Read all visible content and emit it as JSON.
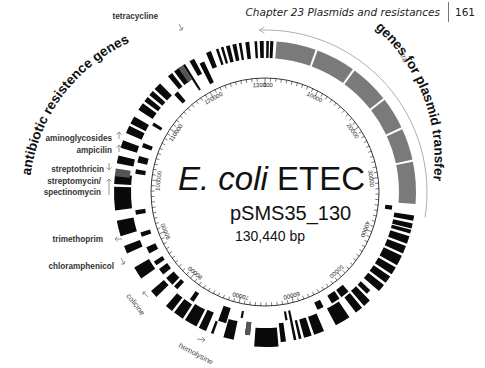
{
  "header": {
    "chapter": "Chapter 23  Plasmids and resistances",
    "page_number": "161"
  },
  "map": {
    "title_italic": "E. coli",
    "title_rest": " ETEC",
    "plasmid_name": "pSMS35_130",
    "size": "130,440 bp",
    "center": [
      265,
      192
    ],
    "tick_radius": 114,
    "gene_inner": 121,
    "gene_outer": 151,
    "outer_arc_radius": 162,
    "colors": {
      "gene": "#0a0a0a",
      "transfer": "#7a7a7a",
      "tick": "#222222",
      "arc": "#999999"
    }
  },
  "group_labels": {
    "left": "antibiotic resistence genes",
    "right": "genes for plasmid transfer",
    "tra": "tra"
  },
  "tick_labels": [
    {
      "text": "1",
      "angle": 0
    },
    {
      "text": "10000",
      "angle": 27.6
    },
    {
      "text": "20000",
      "angle": 55.2
    },
    {
      "text": "30000",
      "angle": 82.8
    },
    {
      "text": "40000",
      "angle": 110.4
    },
    {
      "text": "50000",
      "angle": 138.0
    },
    {
      "text": "60000",
      "angle": 165.6
    },
    {
      "text": "70000",
      "angle": 193.2
    },
    {
      "text": "80000",
      "angle": 220.8
    },
    {
      "text": "90000",
      "angle": 248.4
    },
    {
      "text": "100000",
      "angle": 276.0
    },
    {
      "text": "110000",
      "angle": 303.6
    },
    {
      "text": "120000",
      "angle": 331.2
    },
    {
      "text": "130000",
      "angle": 358.8
    }
  ],
  "resistance_labels": [
    {
      "text": "tetracycline",
      "x": 158,
      "y": 19,
      "arrow": "down-right",
      "ax": 182,
      "ay": 30
    },
    {
      "text": "aminoglycosides",
      "x": 112,
      "y": 141,
      "arrow": "up",
      "ax": 119,
      "ay": 139
    },
    {
      "text": "ampicilin",
      "x": 112,
      "y": 153,
      "arrow": "up",
      "ax": 119,
      "ay": 152
    },
    {
      "text": "streptothricin",
      "x": 104,
      "y": 172,
      "arrow": "down",
      "ax": 109,
      "ay": 170
    },
    {
      "text": "streptomycin/",
      "x": 101,
      "y": 184,
      "arrow": "up-long",
      "ax": 109,
      "ay": 185
    },
    {
      "text": "spectinomycin",
      "x": 101,
      "y": 195,
      "arrow": "none",
      "ax": 0,
      "ay": 0
    },
    {
      "text": "trimethoprim",
      "x": 103,
      "y": 242,
      "arrow": "up-left",
      "ax": 115,
      "ay": 239
    },
    {
      "text": "chloramphenicol",
      "x": 114,
      "y": 269,
      "arrow": "down-right",
      "ax": 124,
      "ay": 264
    }
  ],
  "toxin_labels": [
    {
      "text": "colicine",
      "x": 126,
      "y": 296,
      "rotate": 52,
      "ax": 143,
      "ay": 292
    },
    {
      "text": "hemolysine",
      "x": 178,
      "y": 347,
      "rotate": 28,
      "ax": 203,
      "ay": 339
    }
  ],
  "transfer_region": {
    "start": 4,
    "end": 95,
    "breaks": [
      20,
      36,
      52,
      65,
      78
    ]
  },
  "genes": [
    {
      "s": 96,
      "e": 98,
      "r0": 121,
      "r1": 128
    },
    {
      "s": 99,
      "e": 101,
      "r0": 131,
      "r1": 151
    },
    {
      "s": 102,
      "e": 104,
      "r0": 131,
      "r1": 151
    },
    {
      "s": 104.5,
      "e": 106,
      "r0": 131,
      "r1": 151
    },
    {
      "s": 107,
      "e": 110,
      "r0": 131,
      "r1": 151
    },
    {
      "s": 111,
      "e": 114,
      "r0": 131,
      "r1": 151
    },
    {
      "s": 115,
      "e": 119,
      "r0": 131,
      "r1": 151
    },
    {
      "s": 120,
      "e": 123,
      "r0": 131,
      "r1": 151
    },
    {
      "s": 124,
      "e": 127,
      "r0": 131,
      "r1": 151
    },
    {
      "s": 128,
      "e": 131,
      "r0": 131,
      "r1": 151
    },
    {
      "s": 133,
      "e": 135,
      "r0": 131,
      "r1": 144
    },
    {
      "s": 136,
      "e": 139,
      "r0": 131,
      "r1": 151
    },
    {
      "s": 140,
      "e": 144,
      "r0": 121,
      "r1": 130
    },
    {
      "s": 140,
      "e": 143,
      "r0": 132,
      "r1": 151
    },
    {
      "s": 145,
      "e": 149,
      "r0": 121,
      "r1": 130
    },
    {
      "s": 146,
      "e": 152,
      "r0": 132,
      "r1": 151
    },
    {
      "s": 153,
      "e": 156,
      "r0": 121,
      "r1": 129
    },
    {
      "s": 157,
      "e": 161,
      "r0": 132,
      "r1": 151
    },
    {
      "s": 162,
      "e": 165,
      "r0": 132,
      "r1": 151
    },
    {
      "s": 166,
      "e": 167,
      "r0": 132,
      "r1": 151
    },
    {
      "s": 168,
      "e": 169,
      "r0": 121,
      "r1": 151
    },
    {
      "s": 170,
      "e": 171,
      "r0": 121,
      "r1": 130
    },
    {
      "s": 172,
      "e": 174,
      "r0": 132,
      "r1": 151
    },
    {
      "s": 175,
      "e": 184,
      "r0": 136,
      "r1": 155
    },
    {
      "s": 186,
      "e": 188,
      "r0": 131,
      "r1": 144
    },
    {
      "s": 190,
      "e": 191,
      "r0": 121,
      "r1": 128
    },
    {
      "s": 192,
      "e": 196,
      "r0": 132,
      "r1": 151
    },
    {
      "s": 196.5,
      "e": 200,
      "r0": 121,
      "r1": 137
    },
    {
      "s": 200,
      "e": 201,
      "r0": 138,
      "r1": 151
    },
    {
      "s": 203,
      "e": 206,
      "r0": 131,
      "r1": 151
    },
    {
      "s": 207,
      "e": 212,
      "r0": 132,
      "r1": 151
    },
    {
      "s": 213,
      "e": 215,
      "r0": 121,
      "r1": 131
    },
    {
      "s": 213,
      "e": 217,
      "r0": 134,
      "r1": 151
    },
    {
      "s": 218,
      "e": 221,
      "r0": 134,
      "r1": 151
    },
    {
      "s": 222,
      "e": 224,
      "r0": 121,
      "r1": 131
    },
    {
      "s": 225,
      "e": 229,
      "r0": 121,
      "r1": 131
    },
    {
      "s": 226,
      "e": 229,
      "r0": 134,
      "r1": 151
    },
    {
      "s": 231,
      "e": 234,
      "r0": 121,
      "r1": 131
    },
    {
      "s": 235,
      "e": 240,
      "r0": 134,
      "r1": 151
    },
    {
      "s": 236,
      "e": 238,
      "r0": 121,
      "r1": 131
    },
    {
      "s": 242,
      "e": 245,
      "r0": 121,
      "r1": 131
    },
    {
      "s": 246,
      "e": 249,
      "r0": 134,
      "r1": 151
    },
    {
      "s": 250,
      "e": 252,
      "r0": 121,
      "r1": 131
    },
    {
      "s": 253,
      "e": 259,
      "r0": 134,
      "r1": 151
    },
    {
      "s": 260,
      "e": 262,
      "r0": 121,
      "r1": 131
    },
    {
      "s": 263,
      "e": 272,
      "r0": 134,
      "r1": 151
    },
    {
      "s": 273,
      "e": 277,
      "r0": 134,
      "r1": 151
    },
    {
      "s": 278,
      "e": 280,
      "r0": 121,
      "r1": 131
    },
    {
      "s": 281,
      "e": 284,
      "r0": 134,
      "r1": 151
    },
    {
      "s": 283,
      "e": 286,
      "r0": 121,
      "r1": 131
    },
    {
      "s": 287,
      "e": 290,
      "r0": 134,
      "r1": 151
    },
    {
      "s": 290,
      "e": 292,
      "r0": 121,
      "r1": 131
    },
    {
      "s": 293,
      "e": 296,
      "r0": 134,
      "r1": 151
    },
    {
      "s": 297,
      "e": 300,
      "r0": 134,
      "r1": 151
    },
    {
      "s": 300.5,
      "e": 302,
      "r0": 121,
      "r1": 131
    },
    {
      "s": 303,
      "e": 306,
      "r0": 134,
      "r1": 151
    },
    {
      "s": 307,
      "e": 309,
      "r0": 134,
      "r1": 151
    },
    {
      "s": 310,
      "e": 312,
      "r0": 134,
      "r1": 151
    },
    {
      "s": 313,
      "e": 316,
      "r0": 134,
      "r1": 151
    },
    {
      "s": 317,
      "e": 319,
      "r0": 121,
      "r1": 133
    },
    {
      "s": 320,
      "e": 322,
      "r0": 134,
      "r1": 151
    },
    {
      "s": 323,
      "e": 326,
      "r0": 134,
      "r1": 151
    },
    {
      "s": 327,
      "e": 328,
      "r0": 121,
      "r1": 151
    },
    {
      "s": 330,
      "e": 332,
      "r0": 134,
      "r1": 151
    },
    {
      "s": 333,
      "e": 335,
      "r0": 121,
      "r1": 144
    },
    {
      "s": 337,
      "e": 339,
      "r0": 134,
      "r1": 151
    },
    {
      "s": 341,
      "e": 342,
      "r0": 134,
      "r1": 151
    },
    {
      "s": 343,
      "e": 344,
      "r0": 134,
      "r1": 151
    },
    {
      "s": 345,
      "e": 346.5,
      "r0": 134,
      "r1": 151
    },
    {
      "s": 347.5,
      "e": 349,
      "r0": 134,
      "r1": 151
    },
    {
      "s": 350,
      "e": 351,
      "r0": 134,
      "r1": 151
    },
    {
      "s": 352.5,
      "e": 354,
      "r0": 134,
      "r1": 151
    },
    {
      "s": 356,
      "e": 357,
      "r0": 134,
      "r1": 151
    },
    {
      "s": 358,
      "e": 359.5,
      "r0": 134,
      "r1": 151
    },
    {
      "s": 0.5,
      "e": 1.5,
      "r0": 134,
      "r1": 151
    },
    {
      "s": 2,
      "e": 3.2,
      "r0": 134,
      "r1": 151
    }
  ],
  "gray_genes": [
    {
      "s": 186,
      "e": 188,
      "r0": 131,
      "r1": 144
    },
    {
      "s": 276,
      "e": 279,
      "r0": 136,
      "r1": 151
    },
    {
      "s": 325,
      "e": 327,
      "r0": 134,
      "r1": 151
    }
  ]
}
